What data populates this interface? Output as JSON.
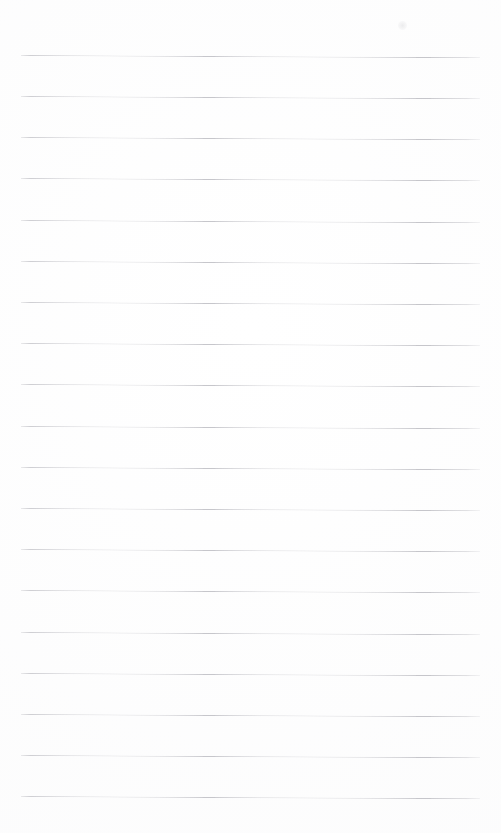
{
  "page": {
    "kind": "scanned-blank-ruled-notepad-page",
    "width_px": 501,
    "height_px": 833,
    "background_color": "#ffffff",
    "has_text_content": false,
    "text_content": "",
    "orientation": "portrait"
  },
  "ruling": {
    "line_color": "#c6c6cb",
    "line_count": 19,
    "line_thickness_px": 1,
    "line_left_x_px": 21,
    "line_right_x_px": 480,
    "line_length_px": 459,
    "first_line_y_px": 55,
    "line_spacing_px": 41.2,
    "slope_deg": 0.28,
    "margin_top_px": 55,
    "margin_bottom_px": 37,
    "margin_left_px": 21,
    "margin_right_px": 21,
    "lines": [
      {
        "index": 1,
        "y_px": 55,
        "content": ""
      },
      {
        "index": 2,
        "y_px": 96,
        "content": ""
      },
      {
        "index": 3,
        "y_px": 137,
        "content": ""
      },
      {
        "index": 4,
        "y_px": 178,
        "content": ""
      },
      {
        "index": 5,
        "y_px": 220,
        "content": ""
      },
      {
        "index": 6,
        "y_px": 261,
        "content": ""
      },
      {
        "index": 7,
        "y_px": 302,
        "content": ""
      },
      {
        "index": 8,
        "y_px": 343,
        "content": ""
      },
      {
        "index": 9,
        "y_px": 384,
        "content": ""
      },
      {
        "index": 10,
        "y_px": 426,
        "content": ""
      },
      {
        "index": 11,
        "y_px": 467,
        "content": ""
      },
      {
        "index": 12,
        "y_px": 508,
        "content": ""
      },
      {
        "index": 13,
        "y_px": 549,
        "content": ""
      },
      {
        "index": 14,
        "y_px": 590,
        "content": ""
      },
      {
        "index": 15,
        "y_px": 632,
        "content": ""
      },
      {
        "index": 16,
        "y_px": 673,
        "content": ""
      },
      {
        "index": 17,
        "y_px": 714,
        "content": ""
      },
      {
        "index": 18,
        "y_px": 755,
        "content": ""
      },
      {
        "index": 19,
        "y_px": 796,
        "content": ""
      }
    ]
  },
  "artifacts": {
    "smudge": {
      "name": "paper-smudge",
      "x_px": 398,
      "y_px": 21,
      "size_px": 9,
      "color": "#96969e"
    }
  }
}
